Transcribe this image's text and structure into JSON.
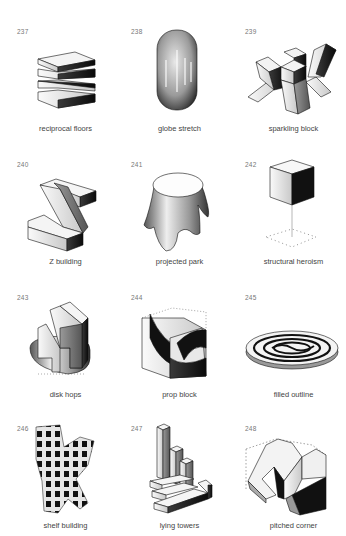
{
  "figures": [
    {
      "number": "237",
      "caption": "reciprocal floors"
    },
    {
      "number": "238",
      "caption": "globe stretch"
    },
    {
      "number": "239",
      "caption": "sparkling block"
    },
    {
      "number": "240",
      "caption": "Z building"
    },
    {
      "number": "241",
      "caption": "projected park"
    },
    {
      "number": "242",
      "caption": "structural heroism"
    },
    {
      "number": "243",
      "caption": "disk hops"
    },
    {
      "number": "244",
      "caption": "prop block"
    },
    {
      "number": "245",
      "caption": "filled outline"
    },
    {
      "number": "246",
      "caption": "shelf building"
    },
    {
      "number": "247",
      "caption": "lying towers"
    },
    {
      "number": "248",
      "caption": "pitched corner"
    }
  ]
}
